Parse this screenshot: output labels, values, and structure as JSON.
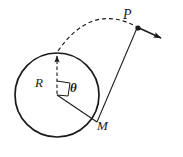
{
  "figure": {
    "background_color": "#ffffff",
    "stroke_color": "#1a1a1a",
    "labels": {
      "point_p": "P",
      "point_m": "M",
      "radius": "R",
      "angle": "θ"
    },
    "geometry": {
      "circle": {
        "center_x": 57,
        "center_y": 95,
        "radius": 42,
        "stroke_width": 1.6
      },
      "center_point": {
        "x": 57,
        "y": 95
      },
      "circle_top_point": {
        "x": 57,
        "y": 53
      },
      "point_m": {
        "x": 97,
        "y": 122
      },
      "point_p": {
        "x": 138,
        "y": 28
      },
      "velocity_arrow_tip": {
        "x": 164,
        "y": 39
      },
      "radius_dashed_line": {
        "x1": 57,
        "y1": 95,
        "x2": 57,
        "y2": 53
      },
      "radius_to_m_line": {
        "x1": 57,
        "y1": 95,
        "x2": 97,
        "y2": 122
      },
      "chord_m_to_p_line": {
        "x1": 97,
        "y1": 122,
        "x2": 138,
        "y2": 28
      },
      "dashed_arc": {
        "start_x": 57,
        "start_y": 53,
        "control_x": 88,
        "control_y": 5,
        "end_x": 138,
        "end_y": 28
      },
      "angle_marker": {
        "vertex_x": 57,
        "vertex_y": 95,
        "size": 14
      }
    },
    "elements": {
      "circle_name": "wheel-circle",
      "dashed_arc_name": "trajectory-arc",
      "velocity_arrow_name": "velocity-arrow",
      "radius_dashed_name": "radius-dashed-line",
      "radius_m_name": "radius-to-m-line",
      "chord_name": "m-to-p-line",
      "angle_marker_name": "angle-marker"
    }
  }
}
